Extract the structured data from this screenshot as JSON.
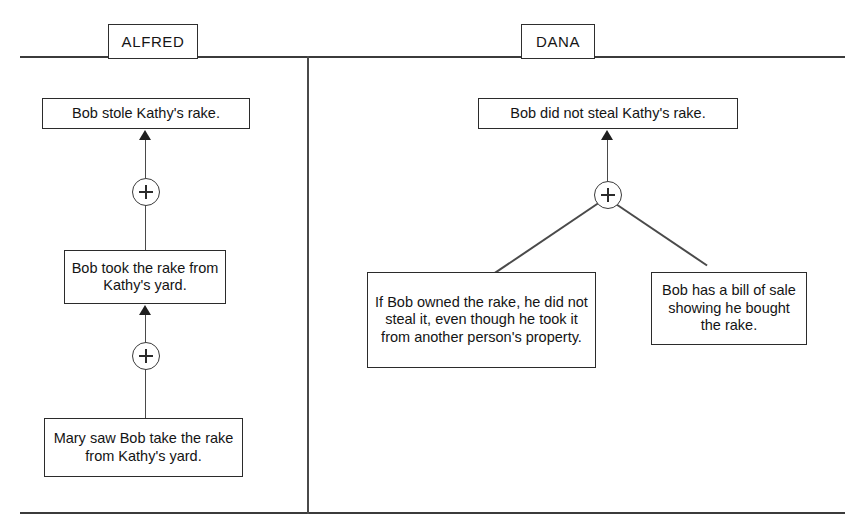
{
  "diagram": {
    "columns": [
      {
        "id": "alfred",
        "header": "ALFRED",
        "conclusion": "Bob stole Kathy's rake.",
        "middle": "Bob took the rake from Kathy's yard.",
        "premise": "Mary saw Bob take the rake from Kathy's yard."
      },
      {
        "id": "dana",
        "header": "DANA",
        "conclusion": "Bob did not steal Kathy's rake.",
        "premise_left": "If Bob owned the rake, he did not steal it, even though he took it from another person's property.",
        "premise_right": "Bob has a bill of sale showing he bought the rake."
      }
    ],
    "node_symbol": "+",
    "colors": {
      "ink": "#1f1f1f",
      "line": "#4a4a4a",
      "background": "#ffffff"
    }
  }
}
